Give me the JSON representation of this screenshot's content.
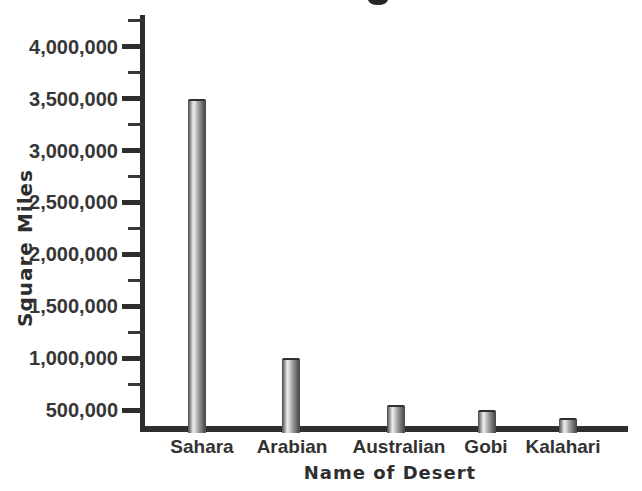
{
  "page": {
    "background": "#ffffff",
    "title_text_visible": false
  },
  "colors": {
    "ink": "#363636",
    "axis": "#2e2e2e",
    "bar_edge": "#454545",
    "bar_highlight": "#ededed",
    "background": "#ffffff"
  },
  "chart_data": {
    "type": "bar",
    "title": "",
    "categories": [
      "Sahara",
      "Arabian",
      "Australian",
      "Gobi",
      "Kalahari"
    ],
    "values": [
      3500000,
      1000000,
      550000,
      500000,
      420000
    ],
    "xlabel": "Name of Desert",
    "ylabel": "Square Miles",
    "yticks": [
      500000,
      1000000,
      1500000,
      2000000,
      2500000,
      3000000,
      3500000,
      4000000
    ],
    "ytick_labels": [
      "500,000",
      "1,000,000",
      "1,500,000",
      "2,000,000",
      "2,500,000",
      "3,000,000",
      "3,500,000",
      "4,000,000"
    ],
    "minor_yticks": [
      750000,
      1250000,
      1750000,
      2250000,
      2750000,
      3250000,
      3750000,
      4250000
    ],
    "ylim": [
      340000,
      4300000
    ],
    "grid": false,
    "legend": false,
    "bar_style": "3d-cylinder-gray-gradient"
  }
}
